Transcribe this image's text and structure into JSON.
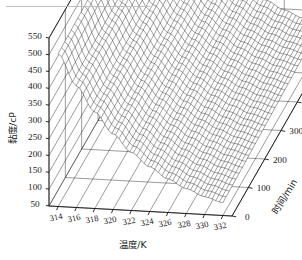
{
  "figure": {
    "background_color": "#ffffff",
    "line_color": "#161616",
    "surface_color": "#111111",
    "scan_artifact_color": "#bfbfbf"
  },
  "chart_data": {
    "type": "surface",
    "title": "",
    "projection": "3d-mesh-surface",
    "grid": true,
    "legend": "none",
    "xlabel": "温度/K",
    "ylabel": "黏度/cP",
    "zlabel": "时间/min",
    "xlabel_text": "温度/K",
    "ylabel_text": "黏度/cP",
    "zlabel_text": "时间/min",
    "xlim": [
      313,
      333
    ],
    "ylim": [
      50,
      550
    ],
    "zlim": [
      0,
      600
    ],
    "xticks": [
      314,
      316,
      318,
      320,
      322,
      324,
      326,
      328,
      330,
      332
    ],
    "yticks": [
      50,
      100,
      150,
      200,
      250,
      300,
      350,
      400,
      450,
      500,
      550
    ],
    "zticks": [
      0,
      100,
      200,
      300,
      400,
      500,
      600
    ],
    "xtick_labels": [
      "314",
      "316",
      "318",
      "320",
      "322",
      "324",
      "326",
      "328",
      "330",
      "332"
    ],
    "ytick_labels": [
      "50",
      "100",
      "150",
      "200",
      "250",
      "300",
      "350",
      "400",
      "450",
      "500",
      "550"
    ],
    "ztick_labels": [
      "0",
      "100",
      "200",
      "300",
      "400",
      "500",
      "600"
    ],
    "x": [
      314,
      316,
      318,
      320,
      322,
      324,
      326,
      328,
      330,
      332
    ],
    "z": [
      0,
      100,
      200,
      300,
      400,
      500,
      600
    ],
    "surface": [
      [
        505,
        412,
        338,
        275,
        223,
        183,
        150,
        124,
        103,
        88
      ],
      [
        508,
        415,
        341,
        278,
        226,
        186,
        153,
        127,
        106,
        91
      ],
      [
        512,
        419,
        345,
        282,
        230,
        190,
        157,
        131,
        110,
        95
      ],
      [
        516,
        423,
        349,
        286,
        234,
        194,
        161,
        135,
        114,
        99
      ],
      [
        520,
        427,
        353,
        290,
        238,
        198,
        165,
        139,
        118,
        103
      ],
      [
        524,
        431,
        357,
        294,
        242,
        202,
        169,
        143,
        122,
        107
      ],
      [
        528,
        435,
        361,
        298,
        246,
        206,
        173,
        147,
        126,
        111
      ]
    ],
    "series": [
      {
        "name": "t = 0 min",
        "values": [
          505,
          412,
          338,
          275,
          223,
          183,
          150,
          124,
          103,
          88
        ]
      },
      {
        "name": "t = 100 min",
        "values": [
          508,
          415,
          341,
          278,
          226,
          186,
          153,
          127,
          106,
          91
        ]
      },
      {
        "name": "t = 200 min",
        "values": [
          512,
          419,
          345,
          282,
          230,
          190,
          157,
          131,
          110,
          95
        ]
      },
      {
        "name": "t = 300 min",
        "values": [
          516,
          423,
          349,
          286,
          234,
          194,
          161,
          135,
          114,
          99
        ]
      },
      {
        "name": "t = 400 min",
        "values": [
          520,
          427,
          353,
          290,
          238,
          198,
          165,
          139,
          118,
          103
        ]
      },
      {
        "name": "t = 500 min",
        "values": [
          524,
          431,
          357,
          294,
          242,
          202,
          169,
          143,
          122,
          107
        ]
      },
      {
        "name": "t = 600 min",
        "values": [
          528,
          435,
          361,
          298,
          246,
          206,
          173,
          147,
          126,
          111
        ]
      }
    ]
  }
}
